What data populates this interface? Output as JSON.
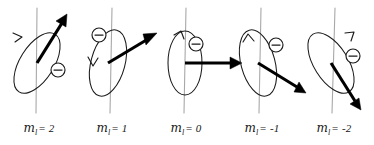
{
  "figure": {
    "background_color": "#ffffff",
    "width": 374,
    "height": 145,
    "axis_color": "#a8a8a8",
    "ink_color": "#1a1a1a",
    "vector_color": "#000000",
    "electron_symbol": "minus-sign",
    "quantum_number_symbol": "m",
    "quantum_number_subscript": "l"
  },
  "panels": [
    {
      "id": "panel-ml-2",
      "label_symbol": "m",
      "label_subscript": "l",
      "label_equals": "= 2",
      "label_full": "m_l = 2",
      "ml_value": 2,
      "axis_x": 37,
      "axis_top": 8,
      "axis_bottom": 113,
      "origin_x": 37,
      "origin_y": 63,
      "ellipse_rx": 34,
      "ellipse_ry": 17,
      "ellipse_rotation_deg": -58,
      "ellipse_cx": 37,
      "ellipse_cy": 63,
      "vector_angle_deg": -58,
      "vector_length": 54,
      "vector_tip_x": 66,
      "vector_tip_y": 17,
      "electron_x": 58,
      "electron_y": 70,
      "electron_r": 7,
      "orbit_arrow_x": 19,
      "orbit_arrow_y": 36,
      "label_left": 8,
      "label_top": 122,
      "label_width": 62
    },
    {
      "id": "panel-ml-1",
      "label_symbol": "m",
      "label_subscript": "l",
      "label_equals": "= 1",
      "label_full": "m_l = 1",
      "ml_value": 1,
      "axis_x": 111,
      "axis_top": 8,
      "axis_bottom": 113,
      "origin_x": 108,
      "origin_y": 63,
      "ellipse_rx": 34,
      "ellipse_ry": 17,
      "ellipse_rotation_deg": -75,
      "ellipse_cx": 108,
      "ellipse_cy": 63,
      "vector_angle_deg": -32,
      "vector_length": 56,
      "vector_tip_x": 155,
      "vector_tip_y": 34,
      "electron_x": 99,
      "electron_y": 35,
      "electron_r": 7,
      "orbit_arrow_x": 93,
      "orbit_arrow_y": 62,
      "label_left": 81,
      "label_top": 122,
      "label_width": 62
    },
    {
      "id": "panel-ml-0",
      "label_symbol": "m",
      "label_subscript": "l",
      "label_equals": "= 0",
      "label_full": "m_l = 0",
      "ml_value": 0,
      "axis_x": 185,
      "axis_top": 8,
      "axis_bottom": 113,
      "origin_x": 185,
      "origin_y": 63,
      "ellipse_rx": 32,
      "ellipse_ry": 17,
      "ellipse_rotation_deg": -90,
      "ellipse_cx": 185,
      "ellipse_cy": 63,
      "vector_angle_deg": 0,
      "vector_length": 56,
      "vector_tip_x": 241,
      "vector_tip_y": 63,
      "electron_x": 196,
      "electron_y": 44,
      "electron_r": 7,
      "orbit_arrow_x": 180,
      "orbit_arrow_y": 33,
      "label_left": 155,
      "label_top": 122,
      "label_width": 62
    },
    {
      "id": "panel-ml--1",
      "label_symbol": "m",
      "label_subscript": "l",
      "label_equals": "= -1",
      "label_full": "m_l = -1",
      "ml_value": -1,
      "axis_x": 260,
      "axis_top": 8,
      "axis_bottom": 113,
      "origin_x": 258,
      "origin_y": 63,
      "ellipse_rx": 34,
      "ellipse_ry": 17,
      "ellipse_rotation_deg": -105,
      "ellipse_cx": 258,
      "ellipse_cy": 63,
      "vector_angle_deg": 32,
      "vector_length": 54,
      "vector_tip_x": 304,
      "vector_tip_y": 92,
      "electron_x": 276,
      "electron_y": 45,
      "electron_r": 7,
      "orbit_arrow_x": 248,
      "orbit_arrow_y": 38,
      "label_left": 228,
      "label_top": 122,
      "label_width": 68
    },
    {
      "id": "panel-ml--2",
      "label_symbol": "m",
      "label_subscript": "l",
      "label_equals": "= -2",
      "label_full": "m_l = -2",
      "ml_value": -2,
      "axis_x": 334,
      "axis_top": 8,
      "axis_bottom": 113,
      "origin_x": 331,
      "origin_y": 63,
      "ellipse_rx": 34,
      "ellipse_ry": 17,
      "ellipse_rotation_deg": -122,
      "ellipse_cx": 331,
      "ellipse_cy": 63,
      "vector_angle_deg": 58,
      "vector_length": 54,
      "vector_tip_x": 360,
      "vector_tip_y": 109,
      "electron_x": 353,
      "electron_y": 56,
      "electron_r": 7,
      "orbit_arrow_x": 352,
      "orbit_arrow_y": 35,
      "label_left": 300,
      "label_top": 122,
      "label_width": 68
    }
  ]
}
